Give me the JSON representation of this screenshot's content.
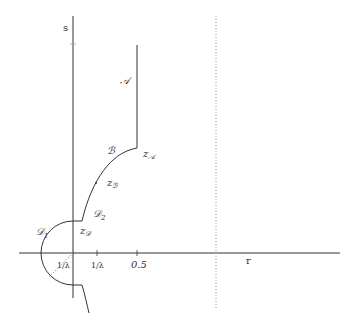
{
  "figure": {
    "axes": {
      "vertical_label": "s",
      "horizontal_label": "r",
      "tick_labels": {
        "inv_lambda_left": "1/λ",
        "inv_lambda_right": "1/λ",
        "half": "0.5"
      }
    },
    "regions": {
      "A": "𝒜",
      "B": "ℬ",
      "D1": "𝒟",
      "D1_sub": "1",
      "D2": "𝒟",
      "D2_sub": "2"
    },
    "points": {
      "zA": {
        "base": "z",
        "sub": "𝒜"
      },
      "zB": {
        "base": "z",
        "sub": "ℬ"
      },
      "zD": {
        "base": "z",
        "sub": "𝒟"
      }
    },
    "colors": {
      "stroke": "#333333",
      "background": "#ffffff",
      "dotted": "#9a9a9a"
    }
  }
}
